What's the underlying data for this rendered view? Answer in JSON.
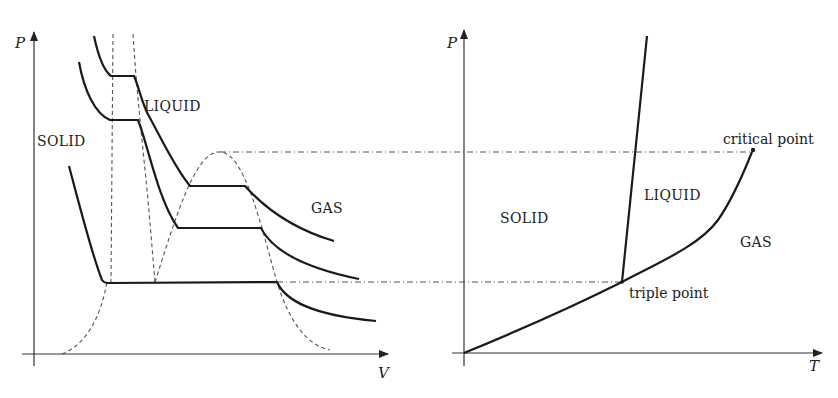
{
  "left_diagram": {
    "title": "P-V diagram",
    "axes": {
      "y_label": "P",
      "x_label": "V"
    },
    "regions": {
      "solid": "SOLID",
      "liquid": "LIQUID",
      "gas": "GAS"
    }
  },
  "right_diagram": {
    "title": "P-T phase diagram",
    "axes": {
      "y_label": "P",
      "x_label": "T"
    },
    "regions": {
      "solid": "SOLID",
      "liquid": "LIQUID",
      "gas": "GAS"
    },
    "annotations": {
      "critical_point": "critical point",
      "triple_point": "triple point"
    }
  },
  "colors": {
    "line": "#1a1a1a",
    "dashed": "#555555",
    "axis": "#333333",
    "background": "#ffffff"
  }
}
